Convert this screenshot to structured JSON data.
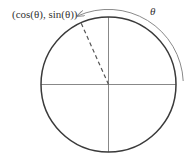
{
  "diagram": {
    "type": "unit-circle",
    "point_label": "(cos(θ), sin(θ))",
    "angle_label": "θ",
    "colors": {
      "circle": "#3a3a3a",
      "axes": "#7a7a7a",
      "radius_dashed": "#555555",
      "arrow": "#8a8a8a",
      "text": "#333333"
    },
    "geometry": {
      "center": [
        108.5,
        84.5
      ],
      "radius": 67.5,
      "arrow_radius": 75,
      "point_angle_deg": 114
    }
  }
}
